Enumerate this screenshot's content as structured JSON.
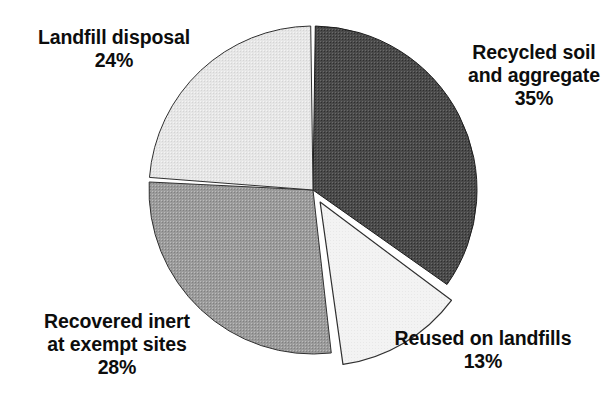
{
  "chart_data": {
    "type": "pie",
    "title": "",
    "subtitle": "",
    "xlabel": "",
    "ylabel": "",
    "legend_position": "none",
    "grid": false,
    "units": "percent",
    "start_angle_deg": 0,
    "direction": "clockwise",
    "categories": [
      "Recycled soil and aggregate",
      "Reused on landfills",
      "Recovered inert at exempt sites",
      "Landfill disposal"
    ],
    "values": [
      35,
      13,
      28,
      24
    ],
    "slices": [
      {
        "name": "recycled-soil-and-aggregate",
        "label_lines": [
          "Recycled soil",
          "and aggregate"
        ],
        "value": 35,
        "value_text": "35%",
        "color": "#4a4a4a",
        "stroke": "#1c1c1c",
        "exploded": false,
        "start_angle_deg": 0,
        "end_angle_deg": 126
      },
      {
        "name": "reused-on-landfills",
        "label_lines": [
          "Reused on landfills"
        ],
        "value": 13,
        "value_text": "13%",
        "color": "#f1f1f1",
        "stroke": "#303030",
        "exploded": true,
        "explode_offset": 14,
        "start_angle_deg": 126,
        "end_angle_deg": 172.8
      },
      {
        "name": "recovered-inert-at-exempt-sites",
        "label_lines": [
          "Recovered inert",
          "at exempt sites"
        ],
        "value": 28,
        "value_text": "28%",
        "color": "#9b9b9b",
        "stroke": "#303030",
        "exploded": false,
        "start_angle_deg": 172.8,
        "end_angle_deg": 273.6
      },
      {
        "name": "landfill-disposal",
        "label_lines": [
          "Landfill disposal"
        ],
        "value": 24,
        "value_text": "24%",
        "color": "#e3e3e3",
        "stroke": "#303030",
        "exploded": false,
        "start_angle_deg": 273.6,
        "end_angle_deg": 360
      }
    ],
    "geometry": {
      "center_x": 313,
      "center_y": 190,
      "radius": 164,
      "gap_deg": 1.6
    },
    "background_color": "#ffffff"
  },
  "labels": {
    "landfill_disposal": {
      "line1": "Landfill disposal",
      "value": "24%"
    },
    "recycled_soil": {
      "line1": "Recycled soil",
      "line2": "and aggregate",
      "value": "35%"
    },
    "recovered_inert": {
      "line1": "Recovered inert",
      "line2": "at exempt sites",
      "value": "28%"
    },
    "reused_landfills": {
      "line1": "Reused on landfills",
      "value": "13%"
    }
  }
}
